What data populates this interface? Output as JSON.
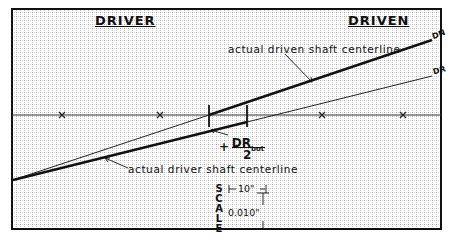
{
  "headers": {
    "left": "DRIVER",
    "right": "DRIVEN"
  },
  "annotations": {
    "driven_centerline": "actual driven shaft centerline",
    "driver_centerline": "actual driver shaft centerline",
    "dn_tag": "DN",
    "dr_tag": "DR",
    "fraction_sign": "+",
    "fraction_numerator": "DR",
    "fraction_subscript": "bot",
    "fraction_denominator": "2"
  },
  "scale": {
    "label_letters": [
      "S",
      "C",
      "A",
      "L",
      "E"
    ],
    "horizontal": "10\"",
    "vertical": "0.010\""
  },
  "colors": {
    "frame": "#111111",
    "grid": "#b9b9b9",
    "line": "#111111",
    "background": "#ffffff"
  }
}
